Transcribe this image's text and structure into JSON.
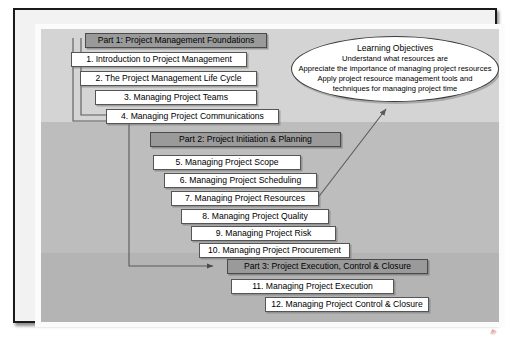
{
  "diagram": {
    "colors": {
      "band_top": "#d4d4d4",
      "band_middle": "#bdbdbd",
      "band_bottom": "#b4b4b4",
      "part_header_fill": "#9a9a9a",
      "chapter_fill": "#ffffff",
      "outline": "#4a4a4a",
      "frame": "#1a1a1a"
    },
    "parts": [
      {
        "id": "part-1",
        "header": "Part 1: Project Management Foundations",
        "chapters": [
          "1. Introduction to Project Management",
          "2. The Project Management Life Cycle",
          "3. Managing Project Teams",
          "4. Managing Project Communications"
        ]
      },
      {
        "id": "part-2",
        "header": "Part 2: Project Initiation & Planning",
        "chapters": [
          "5. Managing Project Scope",
          "6. Managing Project Scheduling",
          "7. Managing Project Resources",
          "8. Managing Project Quality",
          "9. Managing Project Risk",
          "10. Managing Project Procurement"
        ]
      },
      {
        "id": "part-3",
        "header": "Part 3: Project Execution, Control & Closure",
        "chapters": [
          "11. Managing Project Execution",
          "12. Managing Project Control & Closure"
        ]
      }
    ],
    "callout": {
      "title": "Learning Objectives",
      "lines": [
        "Understand what resources are",
        "Appreciate the importance of managing project resources",
        "Apply project resource management tools and",
        "techniques for managing project time"
      ],
      "points_to": "7. Managing Project Resources"
    },
    "connectors": [
      {
        "from": "Part 1: Project Management Foundations",
        "to": "Part 2: Project Initiation & Planning"
      },
      {
        "from": "Part 1: Project Management Foundations",
        "to": "Part 3: Project Execution, Control & Closure"
      },
      {
        "from": "7. Managing Project Resources",
        "to": "Learning Objectives"
      }
    ]
  }
}
